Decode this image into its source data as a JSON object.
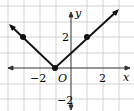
{
  "diagram": {
    "type": "function-graph",
    "function": "y = |x + 1|",
    "axes": {
      "x_label": "x",
      "y_label": "y",
      "origin_label": "O"
    },
    "x_ticks": [
      {
        "value": -2,
        "label": "−2"
      },
      {
        "value": 2,
        "label": "2"
      }
    ],
    "y_ticks": [
      {
        "value": 2,
        "label": "2"
      },
      {
        "value": -2,
        "label": "−2"
      }
    ],
    "x_range": [
      -4,
      4
    ],
    "y_range": [
      -2,
      4
    ],
    "vertex": [
      -1,
      0
    ],
    "points": [
      [
        -3,
        2
      ],
      [
        1,
        2
      ],
      [
        -1,
        0
      ]
    ],
    "colors": {
      "grid": "#c8c8c8",
      "axis": "#333333",
      "line": "#111111"
    }
  }
}
